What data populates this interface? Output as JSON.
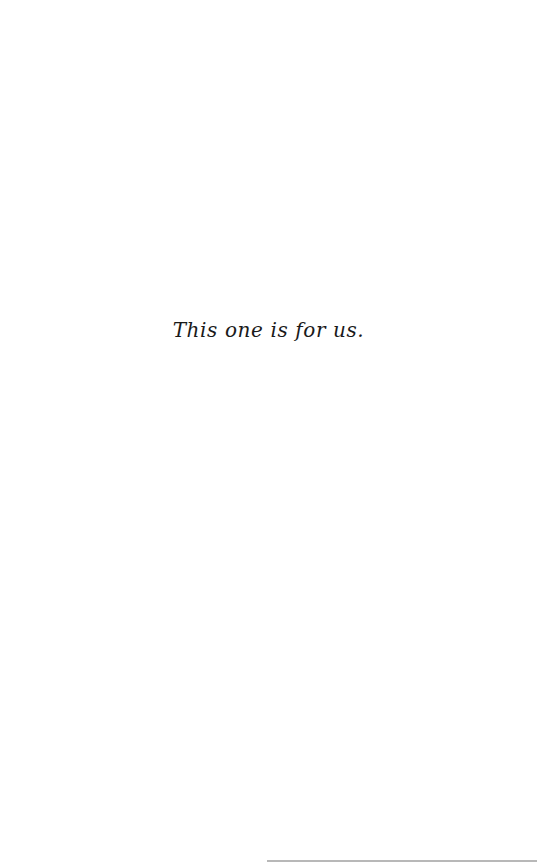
{
  "page": {
    "dedication": "This one is for us."
  }
}
